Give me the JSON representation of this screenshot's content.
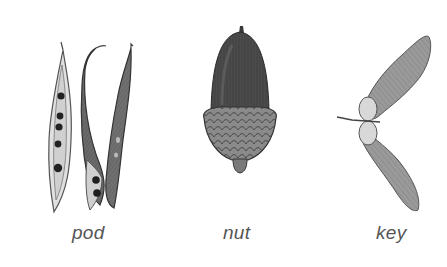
{
  "diagram": {
    "items": [
      {
        "id": "pod",
        "label": "pod"
      },
      {
        "id": "nut",
        "label": "nut"
      },
      {
        "id": "key",
        "label": "key"
      }
    ]
  }
}
